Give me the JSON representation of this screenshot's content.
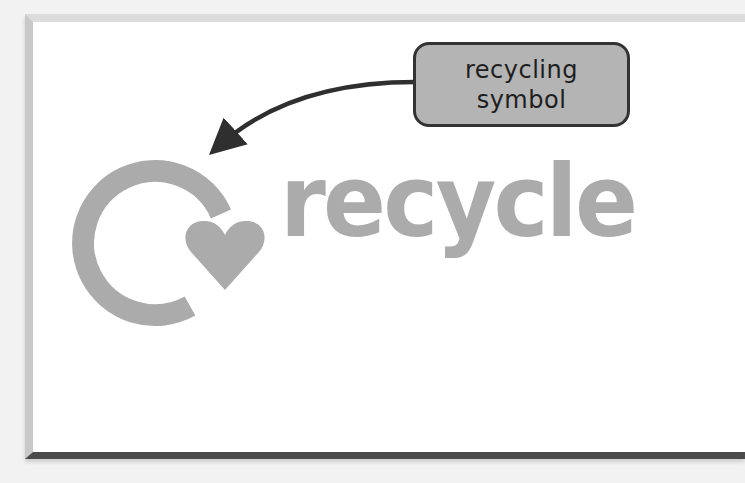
{
  "diagram": {
    "callout": {
      "lines": [
        "recycling",
        "symbol"
      ],
      "fill_color": "#b4b4b4",
      "border_color": "#333333"
    },
    "arrow": {
      "color": "#2f2f2f",
      "from": [
        413,
        82
      ],
      "to": [
        211,
        153
      ]
    },
    "logo": {
      "symbol": "circular-arrow-heart-icon",
      "word": "recycle",
      "color": "#ababab"
    },
    "frame": {
      "background": "#ffffff",
      "outer_background": "#f2f2f2"
    }
  }
}
